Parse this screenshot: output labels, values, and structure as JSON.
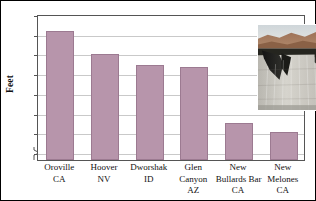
{
  "chart_data": {
    "type": "bar",
    "title": "",
    "xlabel": "",
    "ylabel": "Feet",
    "ylim": [
      590,
      775
    ],
    "yticks": [
      600,
      625,
      650,
      675,
      700,
      725,
      750,
      775
    ],
    "ytick_labels": [
      "600",
      "625",
      "650",
      "675",
      "700",
      "725",
      "750",
      "775"
    ],
    "axis_break": true,
    "grid": true,
    "legend": "none",
    "categories": [
      "Oroville CA",
      "Hoover NV",
      "Dworshak ID",
      "Glen Canyon AZ",
      "New Bullards Bar CA",
      "New Melones CA"
    ],
    "category_lines": [
      [
        "Oroville",
        "CA"
      ],
      [
        "Hoover",
        "NV"
      ],
      [
        "Dworshak",
        "ID"
      ],
      [
        "Glen",
        "Canyon",
        "AZ"
      ],
      [
        "New",
        "Bullards Bar",
        "CA"
      ],
      [
        "New",
        "Melones",
        "CA"
      ]
    ],
    "values": [
      754,
      724,
      711,
      708,
      637,
      625
    ],
    "bar_color": "#b795ab",
    "bar_edge_color": "#9c7a91",
    "grid_color": "#c9c9c9",
    "axis_color": "#555555"
  },
  "inset": {
    "name": "dam-photograph",
    "caption": "",
    "alt": "Photograph of a tall concrete arch dam"
  }
}
